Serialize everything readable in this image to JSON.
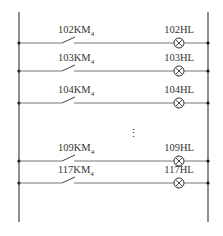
{
  "diagram": {
    "type": "ladder-circuit",
    "colors": {
      "line": "#555555",
      "bus": "#444444",
      "node": "#111111"
    },
    "rungs": [
      {
        "contact": "102KM",
        "contact_sub": "4",
        "lamp": "102HL",
        "y": 43
      },
      {
        "contact": "103KM",
        "contact_sub": "4",
        "lamp": "103HL",
        "y": 71
      },
      {
        "contact": "104KM",
        "contact_sub": "4",
        "lamp": "104HL",
        "y": 103
      },
      {
        "contact": "109KM",
        "contact_sub": "4",
        "lamp": "109HL",
        "y": 161
      },
      {
        "contact": "117KM",
        "contact_sub": "4",
        "lamp": "117HL",
        "y": 183
      }
    ],
    "ellipsis": "⋮"
  }
}
